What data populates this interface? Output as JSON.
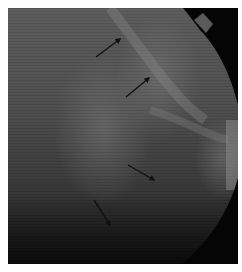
{
  "image": {
    "description": "Grayscale fundus / retinal infrared photograph with four black arrows pointing to features",
    "colors": {
      "background": "#ffffff",
      "tissue_light": "#6a6a6a",
      "tissue_mid": "#4a4a4a",
      "tissue_dark": "#1c1c1c",
      "mask": "#050505",
      "arrow": "#111111"
    },
    "frame": {
      "x": 8,
      "y": 8,
      "width": 230,
      "height": 256
    },
    "arrows": [
      {
        "id": "arrow-1",
        "x1": 96,
        "y1": 57,
        "x2": 120,
        "y2": 39
      },
      {
        "id": "arrow-2",
        "x1": 126,
        "y1": 97,
        "x2": 149,
        "y2": 78
      },
      {
        "id": "arrow-3",
        "x1": 128,
        "y1": 165,
        "x2": 154,
        "y2": 180
      },
      {
        "id": "arrow-4",
        "x1": 94,
        "y1": 200,
        "x2": 110,
        "y2": 225
      }
    ]
  }
}
